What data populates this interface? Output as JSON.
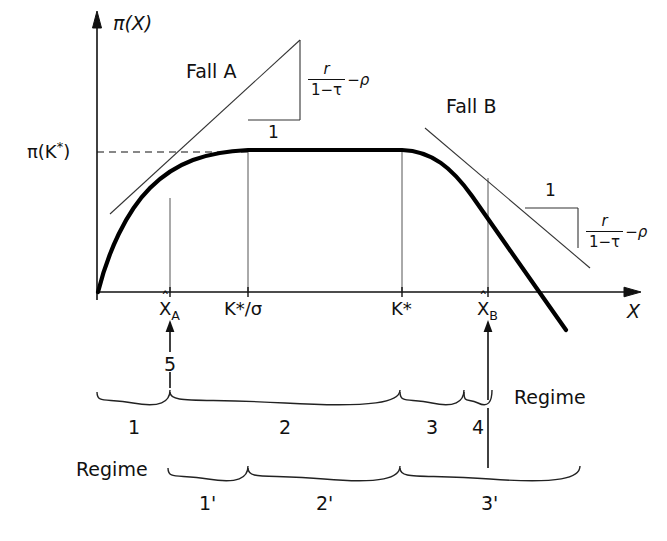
{
  "figure": {
    "kind": "economics-diagram",
    "axis": {
      "y_label": "π(X)",
      "x_label": "X",
      "y_level_label": "π(K*)",
      "y_level_label_parts": {
        "base": "π(K",
        "sup": "*",
        "close": ")"
      }
    },
    "ticks": [
      {
        "id": "x-hat-a",
        "label_base": "X",
        "label_hat": "ˆ",
        "label_sub": "A",
        "x": 170
      },
      {
        "id": "k-star-sigma",
        "label": "K*/σ",
        "x": 248
      },
      {
        "id": "k-star",
        "label": "K*",
        "x": 402
      },
      {
        "id": "x-hat-b",
        "label_base": "X",
        "label_hat": "ˆ",
        "label_sub": "B",
        "x": 488
      }
    ],
    "case_labels": [
      {
        "id": "fall-a",
        "text": "Fall A"
      },
      {
        "id": "fall-b",
        "text": "Fall B"
      }
    ],
    "slope_triangles": [
      {
        "id": "slope-left",
        "rise_label": "1",
        "slope_numerator": "r",
        "slope_denominator": "1−τ",
        "slope_tail": "−ρ"
      },
      {
        "id": "slope-right",
        "rise_label": "1",
        "slope_numerator": "r",
        "slope_denominator": "1−τ",
        "slope_tail": "−ρ"
      }
    ],
    "annotations": [
      {
        "id": "pointer-five",
        "text": "5"
      }
    ],
    "regimes_upper": {
      "title": "Regime",
      "items": [
        {
          "label": "1",
          "from": 97,
          "to": 170
        },
        {
          "label": "2",
          "from": 170,
          "to": 400
        },
        {
          "label": "3",
          "from": 400,
          "to": 464
        },
        {
          "label": "4",
          "from": 464,
          "to": 492
        }
      ]
    },
    "regimes_lower": {
      "title": "Regime",
      "items": [
        {
          "label": "1'",
          "from": 168,
          "to": 248
        },
        {
          "label": "2'",
          "from": 248,
          "to": 400
        },
        {
          "label": "3'",
          "from": 400,
          "to": 580
        }
      ]
    },
    "colors": {
      "ink": "#111111",
      "curve": "#000000",
      "thin": "#333333",
      "background": "#ffffff"
    }
  }
}
